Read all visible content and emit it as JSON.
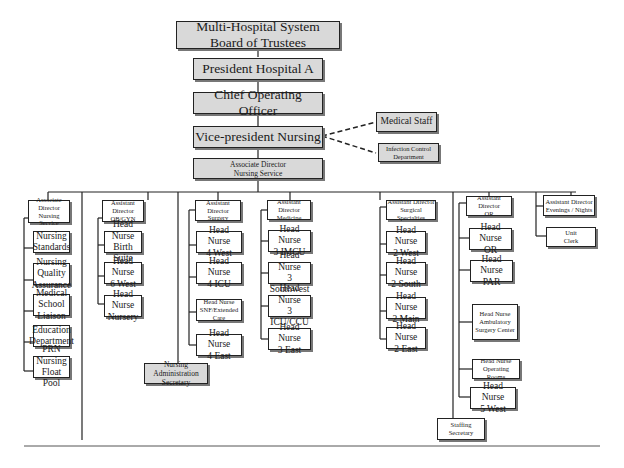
{
  "top_chain": [
    {
      "id": "board",
      "lines": [
        "Multi-Hospital System",
        "Board of Trustees"
      ]
    },
    {
      "id": "president",
      "lines": [
        "President Hospital A"
      ]
    },
    {
      "id": "coo",
      "lines": [
        "Chief  Operating Officer"
      ]
    },
    {
      "id": "vp",
      "lines": [
        "Vice-president Nursing"
      ]
    },
    {
      "id": "assoc",
      "lines": [
        "Associate Director",
        "Nursing Service"
      ]
    }
  ],
  "staff_links": [
    {
      "id": "medstaff",
      "lines": [
        "Medical Staff"
      ]
    },
    {
      "id": "infection",
      "lines": [
        "Infection Control",
        "Department"
      ]
    }
  ],
  "columns": [
    {
      "id": "col1",
      "head": [
        "Associate Director",
        "Nursing Service"
      ],
      "items": [
        [
          "Nursing",
          "Standards"
        ],
        [
          "Nursing Quality",
          "Assurance"
        ],
        [
          "Medical School",
          "Liaison"
        ],
        [
          "Education",
          "Department"
        ],
        [
          "PRN  Nursing",
          "Float Pool"
        ]
      ]
    },
    {
      "id": "col2",
      "head": [
        "Assistant Director",
        "OB/GYN"
      ],
      "items": [
        [
          "Head Nurse",
          "Birth Suite"
        ],
        [
          "Head Nurse",
          "6 West"
        ],
        [
          "Head Nurse",
          "Nursery"
        ]
      ]
    },
    {
      "id": "col3",
      "head": [
        "Assistant Director",
        "Surgery"
      ],
      "items": [
        [
          "Head Nurse",
          "4 West"
        ],
        [
          "Head Nurse",
          "4 ICU"
        ],
        [
          "Head Nurse",
          "SNF/Extended Care"
        ],
        [
          "Head Nurse",
          "4 East"
        ]
      ]
    },
    {
      "id": "col4",
      "head": [
        "Assistant Director",
        "Medicine"
      ],
      "items": [
        [
          "Head Nurse",
          "3 IMCU"
        ],
        [
          "Head Nurse",
          "3 Southwest"
        ],
        [
          "Head Nurse",
          "3 ICU/CCU"
        ],
        [
          "Head Nurse",
          "3 East"
        ]
      ]
    },
    {
      "id": "col5",
      "head": [
        "Assistant Director",
        "Surgical Specialties"
      ],
      "items": [
        [
          "Head Nurse",
          "2 West"
        ],
        [
          "Head Nurse",
          "2 South"
        ],
        [
          "Head Nurse",
          "2 Main"
        ],
        [
          "Head Nurse",
          "2 East"
        ]
      ]
    },
    {
      "id": "col6",
      "head": [
        "Assistant Director",
        "OR"
      ],
      "items": [
        [
          "Head Nurse",
          "OR"
        ],
        [
          "Head Nurse",
          "PAR"
        ],
        [
          "Head Nurse",
          "Ambulatory",
          "Surgery Center"
        ],
        [
          "Head Nurse",
          "Operating Rooms"
        ],
        [
          "Head Nurse",
          "5 West"
        ]
      ]
    },
    {
      "id": "col7",
      "head": [
        "Assistant Director",
        "Evenings / Nights"
      ],
      "items": [
        [
          "Unit",
          "Clerk"
        ]
      ]
    }
  ],
  "secretaries": [
    {
      "id": "nas",
      "lines": [
        "Nursing Administration",
        "Secretary"
      ]
    },
    {
      "id": "staffing",
      "lines": [
        "Staffing",
        "Secretary"
      ]
    }
  ]
}
